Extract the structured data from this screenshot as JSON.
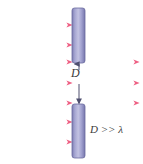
{
  "figure": {
    "background_color": "#ffffff",
    "width": 143,
    "height": 164
  },
  "colors": {
    "wave_arrow": "#f06a8a",
    "wave_arrow_light": "#f8b9c8",
    "barrier_edge": "#7f7fb4",
    "barrier_mid": "#b9b9dd",
    "barrier_outline": "#6a6a9e",
    "dimension_arrow": "#5a5a7a",
    "text": "#3a3a3a"
  },
  "labels": {
    "gap_label": "D",
    "condition_label": "D >> λ"
  },
  "barriers": [
    {
      "name": "upper-barrier",
      "x": 72,
      "y": 8,
      "width": 13,
      "height": 55
    },
    {
      "name": "lower-barrier",
      "x": 72,
      "y": 104,
      "width": 13,
      "height": 54
    }
  ],
  "incoming_waves": {
    "count": 7,
    "x_start": 3,
    "x_end": 72,
    "y_positions": [
      25,
      45,
      62,
      83,
      103,
      122,
      142
    ]
  },
  "outgoing_waves": {
    "count": 3,
    "x_start": 86,
    "x_end": 139,
    "y_positions": [
      62,
      83,
      103
    ]
  },
  "dimension": {
    "name": "aperture-gap-D",
    "x": 79,
    "y_top": 63,
    "y_bottom": 104,
    "value_label": "D"
  }
}
